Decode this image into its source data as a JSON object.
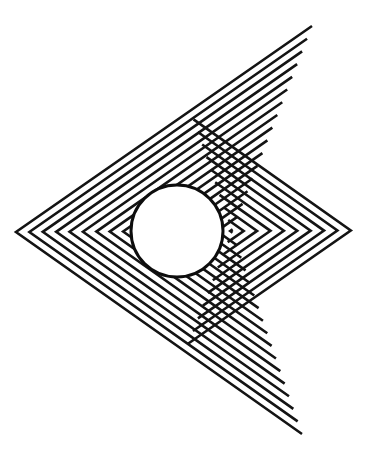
{
  "figure": {
    "canvas": {
      "width": 388,
      "height": 456,
      "background": "#ffffff"
    },
    "ink_color": "#141414",
    "circle_color": "#0d0d0d"
  },
  "pattern": {
    "name": "nested-chevron-triangles",
    "line_count": 26,
    "stroke_width": 2.6,
    "stroke_color": "#141414",
    "geometry_note": "Each element is a three-vertex chevron polyline: top-right apex, left apex, bottom-right apex. Successive elements shrink toward the focus point.",
    "apex_top_right_outer": {
      "x": 312,
      "y": 26
    },
    "apex_bottom_right_outer": {
      "x": 302,
      "y": 434
    },
    "apex_left_outer": {
      "x": 16,
      "y": 232
    },
    "focus_point": {
      "x": 232,
      "y": 231
    },
    "shrink_ratio": 0.062
  },
  "circle": {
    "name": "test-circle",
    "center_x": 177,
    "center_y": 231,
    "radius": 46,
    "stroke_width": 3.0,
    "stroke_color": "#0d0d0d",
    "fill": "none"
  },
  "clipping": {
    "note": "Pattern lines are hidden inside the circle except for the innermost few chevrons, producing the bright inner triangle.",
    "inner_visible_lines": 3
  }
}
